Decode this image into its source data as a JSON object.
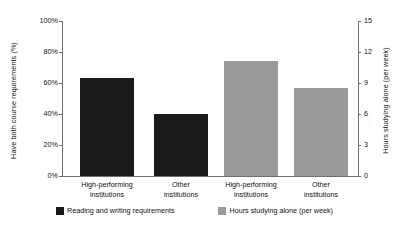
{
  "chart_data": {
    "type": "bar",
    "title": "",
    "xlabel": "",
    "categories": [
      "High-performing institutions",
      "Other institutions",
      "High-performing institutions",
      "Other institutions"
    ],
    "series": [
      {
        "name": "Reading and writing requirements",
        "axis": "left",
        "color": "#1a1a1a",
        "values": [
          63,
          40,
          null,
          null
        ]
      },
      {
        "name": "Hours studying alone (per week)",
        "axis": "right",
        "color": "#9a9a9a",
        "values": [
          null,
          null,
          11.1,
          8.5
        ]
      }
    ],
    "axes": {
      "left": {
        "label": "Have both course requirements (%)",
        "ticks": [
          "0%",
          "20%",
          "40%",
          "60%",
          "80%",
          "100%"
        ],
        "tick_values": [
          0,
          20,
          40,
          60,
          80,
          100
        ],
        "ylim": [
          0,
          100
        ]
      },
      "right": {
        "label": "Hours studying alone (per week)",
        "ticks": [
          "0",
          "3",
          "6",
          "9",
          "12",
          "15"
        ],
        "tick_values": [
          0,
          3,
          6,
          9,
          12,
          15
        ],
        "ylim": [
          0,
          15
        ]
      }
    },
    "grid": false,
    "legend_position": "bottom",
    "legend": [
      {
        "label": "Reading and writing requirements",
        "color": "#1a1a1a"
      },
      {
        "label": "Hours studying alone (per week)",
        "color": "#9a9a9a"
      }
    ]
  },
  "bars": [
    {
      "label_line1": "High-performing",
      "label_line2": "institutions",
      "value": 63,
      "display": "63%",
      "color": "#1a1a1a",
      "axis": "left",
      "pct_of_axis": 63.0
    },
    {
      "label_line1": "Other",
      "label_line2": "institutions",
      "value": 40,
      "display": "40%",
      "color": "#1a1a1a",
      "axis": "left",
      "pct_of_axis": 40.0
    },
    {
      "label_line1": "High-performing",
      "label_line2": "institutions",
      "value": 11.1,
      "display": "11.1",
      "color": "#9a9a9a",
      "axis": "right",
      "pct_of_axis": 74.0
    },
    {
      "label_line1": "Other",
      "label_line2": "institutions",
      "value": 8.5,
      "display": "8.5",
      "color": "#9a9a9a",
      "axis": "right",
      "pct_of_axis": 56.7
    }
  ],
  "left_axis": {
    "title": "Have both course requirements (%)",
    "ticks": [
      "100%",
      "80%",
      "60%",
      "40%",
      "20%",
      "0%"
    ]
  },
  "right_axis": {
    "title": "Hours studying alone (per week)",
    "ticks": [
      "15",
      "12",
      "9",
      "6",
      "3",
      "0"
    ]
  },
  "legend": {
    "items": [
      {
        "label": "Reading and writing requirements",
        "color": "#1a1a1a"
      },
      {
        "label": "Hours studying alone (per week)",
        "color": "#9a9a9a"
      }
    ]
  }
}
